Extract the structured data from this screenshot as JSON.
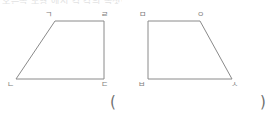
{
  "page": {
    "width": 273,
    "height": 119,
    "background_color": "#ffffff",
    "clipped_top_text": "오른쪽 도형 에서 각 각의 꼭짓점",
    "stroke_color": "#8a8a8a",
    "label_color": "#7d7d7d"
  },
  "figures": [
    {
      "id": "figure-left",
      "name": "left-trapezoid",
      "shape": "trapezoid",
      "vertices": [
        {
          "label": "ㄱ",
          "position": "top-left",
          "x": 55,
          "y": 21,
          "label_x": 45,
          "label_y": 11
        },
        {
          "label": "ㄹ",
          "position": "top-right",
          "x": 104,
          "y": 21,
          "label_x": 101,
          "label_y": 11
        },
        {
          "label": "ㄷ",
          "position": "bottom-right",
          "x": 104,
          "y": 79,
          "label_x": 101,
          "label_y": 81
        },
        {
          "label": "ㄴ",
          "position": "bottom-left",
          "x": 16,
          "y": 79,
          "label_x": 7,
          "label_y": 81
        }
      ],
      "path": "M 55 21 L 104 21 L 104 79 L 16 79 Z"
    },
    {
      "id": "figure-right",
      "name": "right-trapezoid",
      "shape": "trapezoid",
      "vertices": [
        {
          "label": "ㅁ",
          "position": "top-left",
          "x": 148,
          "y": 21,
          "label_x": 139,
          "label_y": 11
        },
        {
          "label": "ㅇ",
          "position": "top-right",
          "x": 200,
          "y": 21,
          "label_x": 197,
          "label_y": 11
        },
        {
          "label": "ㅅ",
          "position": "bottom-right",
          "x": 232,
          "y": 79,
          "label_x": 231,
          "label_y": 81
        },
        {
          "label": "ㅂ",
          "position": "bottom-left",
          "x": 148,
          "y": 79,
          "label_x": 138,
          "label_y": 81
        }
      ],
      "path": "M 148 21 L 200 21 L 232 79 L 148 79 Z"
    }
  ],
  "answer_blank": {
    "open_paren": "(",
    "close_paren": ")",
    "open_x": 110,
    "close_x": 260,
    "y": 97,
    "value": ""
  }
}
